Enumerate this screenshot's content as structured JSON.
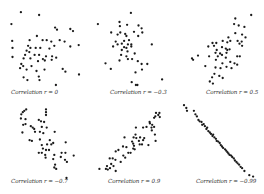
{
  "chart_data": [
    {
      "type": "scatter",
      "title": "Correlation r = 0",
      "r": 0,
      "xlim": [
        0,
        10
      ],
      "ylim": [
        0,
        10
      ],
      "grid": false,
      "axes": false,
      "points": [
        [
          5.5,
          9.4
        ],
        [
          10.3,
          9.0
        ],
        [
          3.0,
          7.7
        ],
        [
          14.5,
          7.2
        ],
        [
          15.0,
          6.9
        ],
        [
          18.5,
          7.0
        ],
        [
          19.2,
          6.7
        ],
        [
          9.7,
          6.0
        ],
        [
          3.2,
          5.3
        ],
        [
          7.8,
          5.4
        ],
        [
          11.2,
          5.4
        ],
        [
          12.3,
          5.4
        ],
        [
          13.5,
          5.2
        ],
        [
          15.7,
          5.4
        ],
        [
          17.0,
          5.2
        ],
        [
          20.7,
          4.7
        ],
        [
          3.3,
          4.3
        ],
        [
          7.4,
          4.6
        ],
        [
          8.0,
          4.3
        ],
        [
          9.4,
          4.3
        ],
        [
          10.6,
          4.3
        ],
        [
          13.0,
          4.2
        ],
        [
          14.3,
          4.6
        ],
        [
          18.5,
          4.5
        ],
        [
          7.0,
          3.9
        ],
        [
          7.7,
          3.7
        ],
        [
          6.6,
          3.3
        ],
        [
          9.1,
          3.3
        ],
        [
          10.3,
          3.3
        ],
        [
          12.1,
          3.1
        ],
        [
          13.7,
          3.1
        ],
        [
          3.3,
          3.0
        ],
        [
          6.2,
          2.8
        ],
        [
          8.0,
          2.8
        ],
        [
          10.0,
          2.4
        ],
        [
          11.3,
          2.7
        ],
        [
          11.8,
          2.5
        ],
        [
          13.6,
          2.6
        ],
        [
          14.8,
          2.9
        ],
        [
          5.6,
          2.0
        ],
        [
          6.1,
          1.7
        ],
        [
          5.3,
          1.4
        ],
        [
          8.3,
          1.7
        ],
        [
          7.0,
          1.2
        ],
        [
          9.6,
          1.0
        ],
        [
          11.7,
          1.2
        ],
        [
          16.5,
          1.3
        ],
        [
          17.2,
          0.9
        ],
        [
          6.2,
          0.1
        ],
        [
          10.2,
          0.2
        ],
        [
          20.8,
          0.5
        ],
        [
          7.2,
          -0.3
        ],
        [
          10.4,
          -0.3
        ],
        [
          14.7,
          -1.0
        ]
      ]
    },
    {
      "type": "scatter",
      "title": "Correlation r = −0.3",
      "r": -0.3,
      "xlim": [
        0,
        10
      ],
      "ylim": [
        0,
        10
      ],
      "grid": false,
      "axes": false,
      "points": [
        [
          11.3,
          9.3
        ],
        [
          2.6,
          7.7
        ],
        [
          8.3,
          8.0
        ],
        [
          8.4,
          7.4
        ],
        [
          10.3,
          7.6
        ],
        [
          13.3,
          7.5
        ],
        [
          14.1,
          7.1
        ],
        [
          12.1,
          6.6
        ],
        [
          14.3,
          6.5
        ],
        [
          6.1,
          6.5
        ],
        [
          8.5,
          6.5
        ],
        [
          7.8,
          6.2
        ],
        [
          9.8,
          6.3
        ],
        [
          10.1,
          6.0
        ],
        [
          13.2,
          6.0
        ],
        [
          7.3,
          5.2
        ],
        [
          9.5,
          5.3
        ],
        [
          10.8,
          5.4
        ],
        [
          8.9,
          4.9
        ],
        [
          10.5,
          4.8
        ],
        [
          11.4,
          4.8
        ],
        [
          16.8,
          4.8
        ],
        [
          6.6,
          4.5
        ],
        [
          7.8,
          4.8
        ],
        [
          9.5,
          4.4
        ],
        [
          10.1,
          4.3
        ],
        [
          11.4,
          4.5
        ],
        [
          8.9,
          4.0
        ],
        [
          10.4,
          3.8
        ],
        [
          12.3,
          3.5
        ],
        [
          8.7,
          3.3
        ],
        [
          10.1,
          3.1
        ],
        [
          10.5,
          2.7
        ],
        [
          8.3,
          2.5
        ],
        [
          11.6,
          2.7
        ],
        [
          13.1,
          2.4
        ],
        [
          14.1,
          2.0
        ],
        [
          15.6,
          2.0
        ],
        [
          4.6,
          2.1
        ],
        [
          6.0,
          1.3
        ],
        [
          12.5,
          0.8
        ],
        [
          14.2,
          1.2
        ],
        [
          11.5,
          -0.6
        ],
        [
          13.0,
          -1.0
        ],
        [
          12.6,
          -1.0
        ],
        [
          19.5,
          -0.2
        ]
      ]
    },
    {
      "type": "scatter",
      "title": "Correlation r = 0.5",
      "r": 0.5,
      "xlim": [
        0,
        10
      ],
      "ylim": [
        0,
        10
      ],
      "grid": false,
      "axes": false,
      "points": [
        [
          19.8,
          9.0
        ],
        [
          15.6,
          8.5
        ],
        [
          15.3,
          7.7
        ],
        [
          16.5,
          7.5
        ],
        [
          18.0,
          7.3
        ],
        [
          15.6,
          6.4
        ],
        [
          17.4,
          6.2
        ],
        [
          18.3,
          5.8
        ],
        [
          13.8,
          5.8
        ],
        [
          12.3,
          5.3
        ],
        [
          13.5,
          5.1
        ],
        [
          14.3,
          5.3
        ],
        [
          16.2,
          5.3
        ],
        [
          17.3,
          5.2
        ],
        [
          9.6,
          5.0
        ],
        [
          10.6,
          5.0
        ],
        [
          16.7,
          4.9
        ],
        [
          17.4,
          4.6
        ],
        [
          8.5,
          4.5
        ],
        [
          10.0,
          4.6
        ],
        [
          12.1,
          4.4
        ],
        [
          13.1,
          4.2
        ],
        [
          13.5,
          4.0
        ],
        [
          14.1,
          4.1
        ],
        [
          10.7,
          4.0
        ],
        [
          10.4,
          3.6
        ],
        [
          11.6,
          3.5
        ],
        [
          13.3,
          3.6
        ],
        [
          8.7,
          3.1
        ],
        [
          11.0,
          3.1
        ],
        [
          12.1,
          3.3
        ],
        [
          13.1,
          2.9
        ],
        [
          16.1,
          3.1
        ],
        [
          16.8,
          3.1
        ],
        [
          4.2,
          2.8
        ],
        [
          4.5,
          2.6
        ],
        [
          5.8,
          3.2
        ],
        [
          10.5,
          2.6
        ],
        [
          12.2,
          2.1
        ],
        [
          14.3,
          2.3
        ],
        [
          15.4,
          2.1
        ],
        [
          16.1,
          1.9
        ],
        [
          7.7,
          1.7
        ],
        [
          10.4,
          1.5
        ],
        [
          11.7,
          1.4
        ],
        [
          13.3,
          1.6
        ],
        [
          14.6,
          1.4
        ],
        [
          10.1,
          0.6
        ],
        [
          11.4,
          0.3
        ],
        [
          12.3,
          0.0
        ],
        [
          9.5,
          0.1
        ],
        [
          8.9,
          -0.5
        ],
        [
          9.7,
          -0.8
        ]
      ]
    },
    {
      "type": "scatter",
      "title": "Correlation r = −0.7",
      "r": -0.7,
      "xlim": [
        0,
        10
      ],
      "ylim": [
        0,
        10
      ],
      "grid": false,
      "axes": false,
      "points": [
        [
          3.0,
          11.0
        ],
        [
          6.9,
          8.8
        ],
        [
          6.4,
          8.6
        ],
        [
          6.0,
          8.4
        ],
        [
          5.6,
          8.1
        ],
        [
          12.1,
          8.8
        ],
        [
          12.1,
          8.4
        ],
        [
          12.1,
          8.0
        ],
        [
          5.5,
          7.5
        ],
        [
          6.7,
          7.4
        ],
        [
          10.2,
          7.3
        ],
        [
          10.8,
          7.1
        ],
        [
          11.6,
          7.0
        ],
        [
          6.7,
          6.7
        ],
        [
          6.1,
          6.6
        ],
        [
          8.1,
          6.4
        ],
        [
          8.6,
          6.2
        ],
        [
          9.0,
          6.0
        ],
        [
          11.0,
          6.3
        ],
        [
          12.3,
          6.2
        ],
        [
          9.2,
          5.6
        ],
        [
          10.5,
          5.6
        ],
        [
          11.4,
          5.4
        ],
        [
          14.4,
          5.6
        ],
        [
          5.9,
          5.5
        ],
        [
          7.8,
          4.4
        ],
        [
          8.4,
          4.3
        ],
        [
          10.5,
          4.5
        ],
        [
          13.1,
          4.4
        ],
        [
          14.0,
          4.0
        ],
        [
          13.5,
          3.8
        ],
        [
          11.0,
          3.7
        ],
        [
          12.4,
          3.8
        ],
        [
          17.3,
          4.1
        ],
        [
          11.3,
          3.2
        ],
        [
          12.1,
          3.0
        ],
        [
          12.9,
          3.0
        ],
        [
          10.2,
          2.6
        ],
        [
          11.0,
          2.6
        ],
        [
          11.9,
          2.3
        ],
        [
          16.2,
          2.6
        ],
        [
          17.2,
          2.6
        ],
        [
          14.3,
          2.3
        ],
        [
          16.0,
          2.0
        ],
        [
          19.4,
          2.2
        ],
        [
          12.0,
          1.9
        ],
        [
          14.0,
          1.7
        ],
        [
          17.1,
          1.6
        ],
        [
          17.6,
          1.3
        ],
        [
          14.5,
          0.9
        ],
        [
          14.3,
          0.5
        ],
        [
          14.8,
          0.3
        ],
        [
          17.5,
          -1.0
        ]
      ]
    },
    {
      "type": "scatter",
      "title": "Correlation r = 0.9",
      "r": 0.9,
      "xlim": [
        0,
        10
      ],
      "ylim": [
        0,
        10
      ],
      "grid": false,
      "axes": false,
      "points": [
        [
          17.9,
          8.3
        ],
        [
          18.5,
          8.0
        ],
        [
          18.8,
          8.3
        ],
        [
          17.7,
          7.8
        ],
        [
          17.4,
          7.6
        ],
        [
          18.9,
          7.7
        ],
        [
          16.2,
          7.0
        ],
        [
          16.9,
          6.6
        ],
        [
          17.4,
          6.3
        ],
        [
          16.7,
          6.2
        ],
        [
          15.4,
          6.3
        ],
        [
          14.5,
          6.2
        ],
        [
          12.6,
          6.2
        ],
        [
          16.3,
          6.8
        ],
        [
          16.8,
          5.8
        ],
        [
          17.6,
          5.2
        ],
        [
          12.5,
          5.2
        ],
        [
          12.0,
          4.8
        ],
        [
          12.7,
          4.7
        ],
        [
          13.7,
          4.8
        ],
        [
          14.8,
          4.7
        ],
        [
          14.5,
          4.4
        ],
        [
          9.6,
          4.8
        ],
        [
          13.4,
          4.3
        ],
        [
          17.8,
          4.3
        ],
        [
          11.6,
          4.2
        ],
        [
          11.9,
          3.9
        ],
        [
          12.1,
          3.6
        ],
        [
          13.6,
          3.8
        ],
        [
          14.2,
          3.8
        ],
        [
          15.9,
          3.7
        ],
        [
          11.9,
          3.2
        ],
        [
          12.3,
          3.1
        ],
        [
          9.2,
          3.5
        ],
        [
          10.1,
          3.4
        ],
        [
          8.0,
          3.0
        ],
        [
          7.3,
          2.8
        ],
        [
          10.6,
          2.6
        ],
        [
          11.2,
          2.6
        ],
        [
          9.3,
          2.2
        ],
        [
          9.8,
          1.9
        ],
        [
          5.7,
          1.8
        ],
        [
          6.5,
          1.8
        ],
        [
          7.2,
          1.6
        ],
        [
          8.6,
          1.3
        ],
        [
          6.1,
          1.0
        ],
        [
          6.7,
          0.7
        ],
        [
          5.0,
          0.7
        ],
        [
          3.0,
          0.3
        ],
        [
          4.7,
          0.3
        ],
        [
          5.8,
          0.4
        ],
        [
          5.2,
          0.2
        ],
        [
          7.3,
          0.0
        ]
      ]
    },
    {
      "type": "scatter",
      "title": "Correlation r = −0.99",
      "r": -0.99,
      "xlim": [
        0,
        10
      ],
      "ylim": [
        0,
        10
      ],
      "grid": false,
      "axes": false,
      "points": [
        [
          2.1,
          9.4
        ],
        [
          2.7,
          9.0
        ],
        [
          2.9,
          8.6
        ],
        [
          4.7,
          8.6
        ],
        [
          5.1,
          8.1
        ],
        [
          5.5,
          7.8
        ],
        [
          5.9,
          7.3
        ],
        [
          6.2,
          7.1
        ],
        [
          6.7,
          7.0
        ],
        [
          6.9,
          6.6
        ],
        [
          7.3,
          6.7
        ],
        [
          7.6,
          6.4
        ],
        [
          8.0,
          6.0
        ],
        [
          8.2,
          6.2
        ],
        [
          8.5,
          5.7
        ],
        [
          8.9,
          5.5
        ],
        [
          9.2,
          5.3
        ],
        [
          9.6,
          5.0
        ],
        [
          9.8,
          5.2
        ],
        [
          10.1,
          4.8
        ],
        [
          10.5,
          4.6
        ],
        [
          10.7,
          4.3
        ],
        [
          11.1,
          4.2
        ],
        [
          11.5,
          4.0
        ],
        [
          11.8,
          3.7
        ],
        [
          12.1,
          3.5
        ],
        [
          12.4,
          3.3
        ],
        [
          12.9,
          3.1
        ],
        [
          13.2,
          2.9
        ],
        [
          13.5,
          2.7
        ],
        [
          13.8,
          2.5
        ],
        [
          14.1,
          2.3
        ],
        [
          14.5,
          2.2
        ],
        [
          14.8,
          2.0
        ],
        [
          15.2,
          1.8
        ],
        [
          15.5,
          1.5
        ],
        [
          15.9,
          1.3
        ],
        [
          16.2,
          1.1
        ],
        [
          16.6,
          0.9
        ],
        [
          17.0,
          0.6
        ],
        [
          17.4,
          0.4
        ],
        [
          18.0,
          0.0
        ],
        [
          19.3,
          -0.6
        ],
        [
          20.3,
          -0.8
        ]
      ]
    }
  ]
}
